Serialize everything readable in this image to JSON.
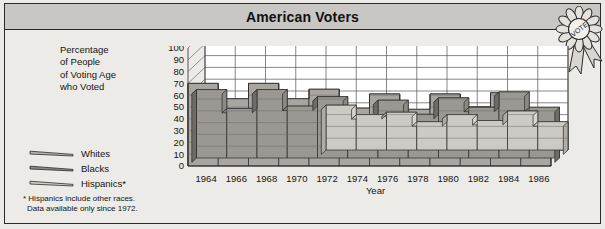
{
  "header": {
    "title": "American Voters",
    "badge_label": "VOTE",
    "badge_icon": "award-rosette-icon"
  },
  "axis": {
    "ylabel_lines": [
      "Percentage",
      "of People",
      "of Voting Age",
      "who Voted"
    ],
    "ylabel_full": "Percentage of People of Voting Age who Voted",
    "xlabel": "Year"
  },
  "legend": {
    "items": [
      {
        "label": "Whites",
        "color": "#c3c0bb",
        "swatch": "ribbon-wedge-icon"
      },
      {
        "label": "Blacks",
        "color": "#8d8a85",
        "swatch": "ribbon-wedge-icon"
      },
      {
        "label": "Hispanics*",
        "color": "#d8d5d0",
        "swatch": "ribbon-wedge-icon"
      }
    ]
  },
  "footnote": {
    "line1": "* Hispanics include other races.",
    "line2": "Data available only since 1972."
  },
  "colors": {
    "page_background": "#eceae7",
    "panel_background": "#edebe8",
    "titlebar_background": "#c9c7c4",
    "border": "#2a2a2a",
    "plot_background": "#ffffff",
    "grid": "#555555",
    "whites_top": "#c3c0bb",
    "whites_front": "#a9a6a1",
    "whites_side": "#8e8b86",
    "blacks_top": "#8d8a85",
    "blacks_front": "#9b9893",
    "blacks_side": "#757islands",
    "hispanics_top": "#d8d5d0",
    "hispanics_front": "#cdcac5",
    "hispanics_side": "#b0ada8"
  },
  "chart_data": {
    "type": "area",
    "title": "American Voters",
    "xlabel": "Year",
    "ylabel": "Percentage of People of Voting Age who Voted",
    "x": [
      1964,
      1966,
      1968,
      1970,
      1972,
      1974,
      1976,
      1978,
      1980,
      1982,
      1984,
      1986
    ],
    "categories": [
      "1964",
      "1966",
      "1968",
      "1970",
      "1972",
      "1974",
      "1976",
      "1978",
      "1980",
      "1982",
      "1984",
      "1986"
    ],
    "ylim": [
      0,
      100
    ],
    "yticks": [
      0,
      10,
      20,
      30,
      40,
      50,
      60,
      70,
      80,
      90,
      100
    ],
    "grid": true,
    "legend_position": "left",
    "three_d": true,
    "series": [
      {
        "name": "Whites",
        "values": [
          70,
          57,
          70,
          57,
          65,
          49,
          61,
          48,
          61,
          50,
          62,
          47
        ],
        "note": "back ribbon"
      },
      {
        "name": "Blacks",
        "values": [
          58,
          42,
          58,
          44,
          52,
          34,
          49,
          37,
          51,
          43,
          56,
          43
        ],
        "note": "middle ribbon"
      },
      {
        "name": "Hispanics*",
        "values": [
          null,
          null,
          null,
          null,
          38,
          30,
          32,
          24,
          30,
          25,
          33,
          24
        ],
        "note": "front ribbon, data only from 1972"
      }
    ]
  }
}
